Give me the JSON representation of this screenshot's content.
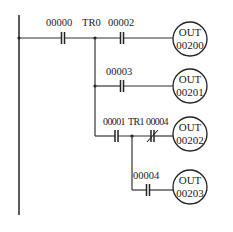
{
  "diagram": {
    "type": "ladder-logic",
    "colors": {
      "line": "#333333",
      "background": "#ffffff"
    },
    "rungs": [
      {
        "id": "rung-1",
        "contacts": [
          {
            "label": "00000",
            "type": "normally-open"
          },
          {
            "label": "00002",
            "type": "normally-open"
          }
        ],
        "branch_point": "TR0",
        "coil": {
          "line1": "OUT",
          "line2": "00200"
        }
      },
      {
        "id": "rung-2",
        "contacts": [
          {
            "label": "00003",
            "type": "normally-open"
          }
        ],
        "coil": {
          "line1": "OUT",
          "line2": "00201"
        }
      },
      {
        "id": "rung-3",
        "contacts": [
          {
            "label": "00001",
            "type": "normally-open"
          },
          {
            "label": "00004",
            "type": "normally-closed"
          }
        ],
        "branch_point": "TR1",
        "coil": {
          "line1": "OUT",
          "line2": "00202"
        }
      },
      {
        "id": "rung-4",
        "contacts": [
          {
            "label": "00004",
            "type": "normally-open"
          }
        ],
        "coil": {
          "line1": "OUT",
          "line2": "00203"
        }
      }
    ]
  }
}
